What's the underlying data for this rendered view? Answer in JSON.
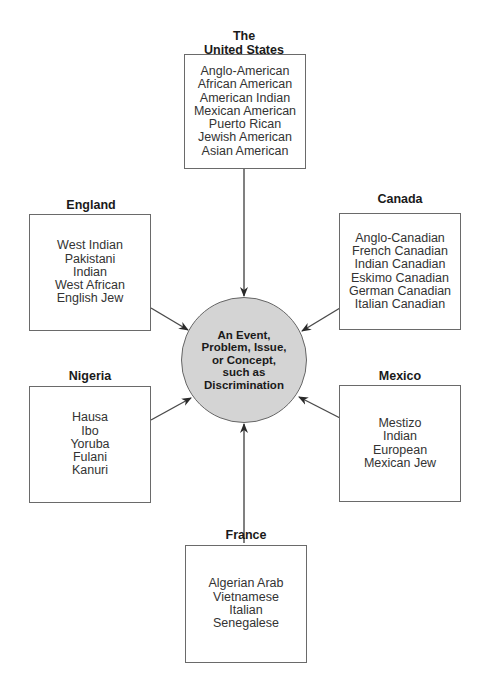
{
  "diagram": {
    "type": "hub-and-spoke",
    "center": {
      "lines": [
        "An Event,",
        "Problem, Issue,",
        "or Concept,",
        "such as",
        "Discrimination"
      ],
      "fill_color": "#d4d4d4"
    },
    "nodes": [
      {
        "id": "united-states",
        "title_lines": [
          "The",
          "United States"
        ],
        "items": [
          "Anglo-American",
          "African American",
          "American Indian",
          "Mexican American",
          "Puerto Rican",
          "Jewish American",
          "Asian American"
        ]
      },
      {
        "id": "england",
        "title_lines": [
          "England"
        ],
        "items": [
          "West Indian",
          "Pakistani",
          "Indian",
          "West African",
          "English Jew"
        ]
      },
      {
        "id": "canada",
        "title_lines": [
          "Canada"
        ],
        "items": [
          "Anglo-Canadian",
          "French Canadian",
          "Indian Canadian",
          "Eskimo Canadian",
          "German Canadian",
          "Italian Canadian"
        ]
      },
      {
        "id": "nigeria",
        "title_lines": [
          "Nigeria"
        ],
        "items": [
          "Hausa",
          "Ibo",
          "Yoruba",
          "Fulani",
          "Kanuri"
        ]
      },
      {
        "id": "mexico",
        "title_lines": [
          "Mexico"
        ],
        "items": [
          "Mestizo",
          "Indian",
          "European",
          "Mexican Jew"
        ]
      },
      {
        "id": "france",
        "title_lines": [
          "France"
        ],
        "items": [
          "Algerian Arab",
          "Vietnamese",
          "Italian",
          "Senegalese"
        ]
      }
    ],
    "arrows": [
      {
        "from": "united-states",
        "to": "center"
      },
      {
        "from": "england",
        "to": "center"
      },
      {
        "from": "canada",
        "to": "center"
      },
      {
        "from": "nigeria",
        "to": "center"
      },
      {
        "from": "mexico",
        "to": "center"
      },
      {
        "from": "france",
        "to": "center"
      }
    ]
  }
}
